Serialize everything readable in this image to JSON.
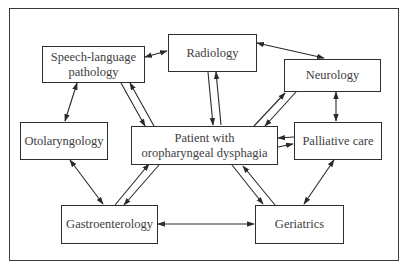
{
  "diagram": {
    "title": "",
    "nodes": {
      "speech": {
        "label": "Speech-language pathology",
        "line1": "Speech-language",
        "line2": "pathology"
      },
      "radiology": {
        "label": "Radiology"
      },
      "neurology": {
        "label": "Neurology"
      },
      "otolaryngology": {
        "label": "Otolaryngology"
      },
      "patient": {
        "label": "Patient with oropharyngeal dysphagia",
        "line1": "Patient with",
        "line2": "oropharyngeal dysphagia"
      },
      "palliative": {
        "label": "Palliative care"
      },
      "gastro": {
        "label": "Gastroenterology"
      },
      "geriatrics": {
        "label": "Geriatrics"
      }
    },
    "edges": [
      {
        "from": "Speech-language pathology",
        "to": "Radiology",
        "type": "bidirectional"
      },
      {
        "from": "Radiology",
        "to": "Neurology",
        "type": "bidirectional"
      },
      {
        "from": "Speech-language pathology",
        "to": "Otolaryngology",
        "type": "bidirectional"
      },
      {
        "from": "Neurology",
        "to": "Palliative care",
        "type": "bidirectional"
      },
      {
        "from": "Otolaryngology",
        "to": "Gastroenterology",
        "type": "bidirectional"
      },
      {
        "from": "Palliative care",
        "to": "Geriatrics",
        "type": "bidirectional"
      },
      {
        "from": "Gastroenterology",
        "to": "Geriatrics",
        "type": "bidirectional"
      },
      {
        "from": "Patient with oropharyngeal dysphagia",
        "to": "Speech-language pathology",
        "type": "paired"
      },
      {
        "from": "Patient with oropharyngeal dysphagia",
        "to": "Radiology",
        "type": "paired"
      },
      {
        "from": "Patient with oropharyngeal dysphagia",
        "to": "Neurology",
        "type": "paired"
      },
      {
        "from": "Patient with oropharyngeal dysphagia",
        "to": "Palliative care",
        "type": "paired"
      },
      {
        "from": "Patient with oropharyngeal dysphagia",
        "to": "Gastroenterology",
        "type": "paired"
      },
      {
        "from": "Patient with oropharyngeal dysphagia",
        "to": "Geriatrics",
        "type": "paired"
      }
    ],
    "colors": {
      "line": "#2a2a2a",
      "text": "#3d3d3d",
      "background": "#ffffff"
    }
  }
}
